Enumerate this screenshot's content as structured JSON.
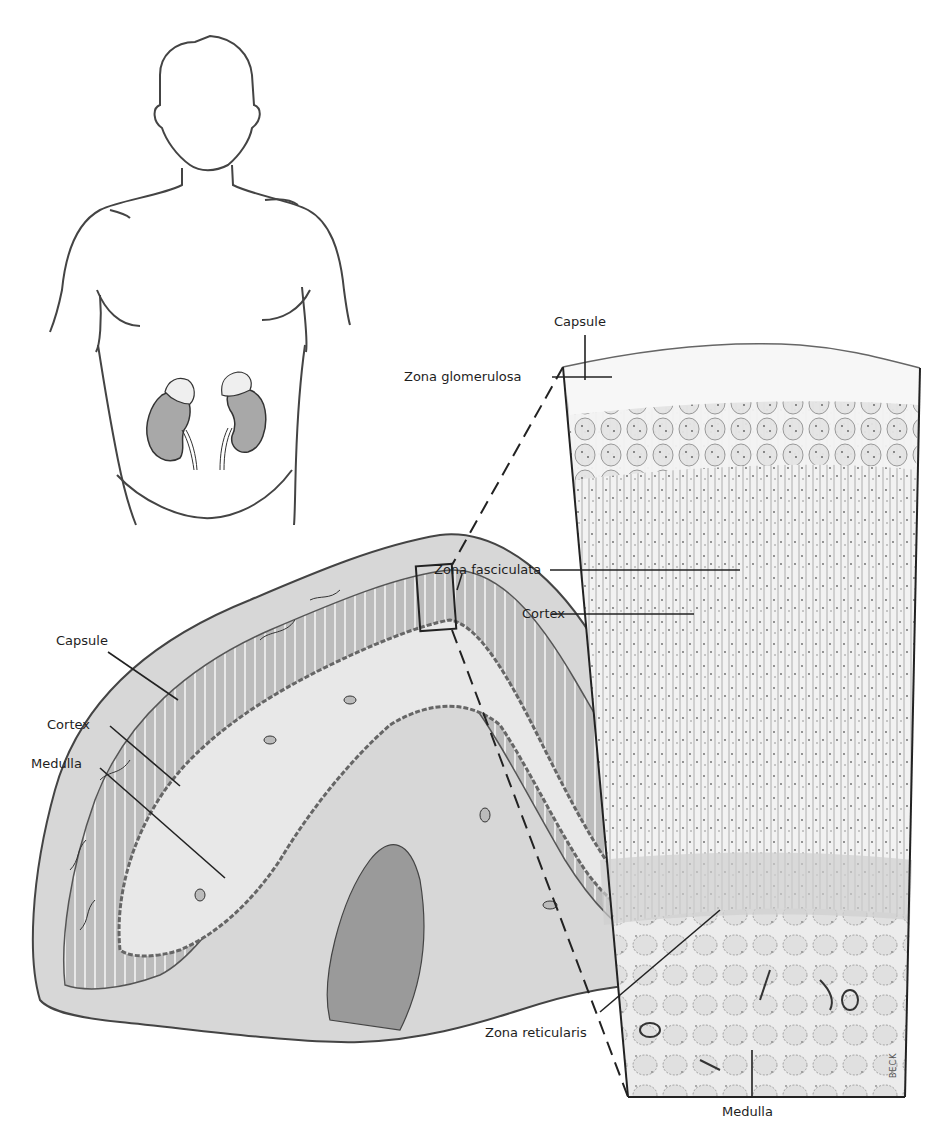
{
  "figure": {
    "panels": [
      {
        "id": "body",
        "description": "Human torso outline showing kidneys with adrenal glands on top"
      },
      {
        "id": "section",
        "description": "Cross-section of adrenal gland"
      },
      {
        "id": "histology",
        "description": "Magnified histology of adrenal cortex zones and medulla"
      }
    ]
  },
  "labels": {
    "section": {
      "capsule": "Capsule",
      "cortex": "Cortex",
      "medulla": "Medulla"
    },
    "histology": {
      "capsule": "Capsule",
      "zona_glomerulosa": "Zona glomerulosa",
      "zona_fasciculata": "Zona fasciculata",
      "cortex": "Cortex",
      "zona_reticularis": "Zona reticularis",
      "medulla": "Medulla"
    },
    "signature": "BECK"
  },
  "colors": {
    "ink": "#2a2a2a",
    "cortex_fill": "#b9b9b9",
    "medulla_fill": "#e6e6e6",
    "kidney_fill": "#a8a8a8",
    "tissue_fill": "#f0f0f0"
  }
}
